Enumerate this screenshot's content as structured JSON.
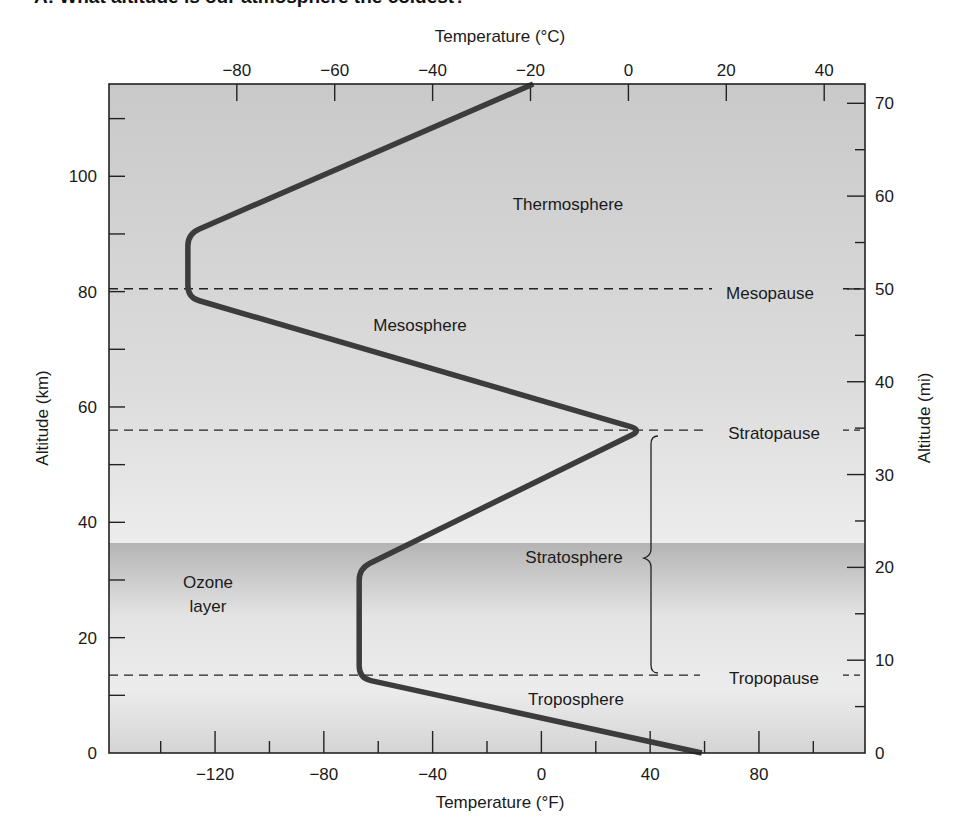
{
  "question": {
    "title": "A: What altitude is our atmosphere the coldest?"
  },
  "chart_data": {
    "type": "line",
    "title": "",
    "xlabel": "Temperature (°F)",
    "x2label": "Temperature (°C)",
    "ylabel": "Altitude (km)",
    "y2label": "Altitude (mi)",
    "xlim_F": [
      -159,
      119
    ],
    "ylim_km": [
      0,
      116
    ],
    "grid": false,
    "legend": null,
    "x_ticks_F": [
      -120,
      -80,
      -40,
      0,
      40,
      80
    ],
    "x_ticks_F_labels": [
      "−120",
      "−80",
      "−40",
      "0",
      "40",
      "80"
    ],
    "x_ticks_C": [
      -80,
      -60,
      -40,
      -20,
      0,
      20,
      40
    ],
    "x_ticks_C_labels": [
      "−80",
      "−60",
      "−40",
      "−20",
      "0",
      "20",
      "40"
    ],
    "y_ticks_km": [
      0,
      20,
      40,
      60,
      80,
      100
    ],
    "y_ticks_km_labels": [
      "0",
      "20",
      "40",
      "60",
      "80",
      "100"
    ],
    "y_ticks_mi": [
      0,
      10,
      20,
      30,
      40,
      50,
      60,
      70
    ],
    "y_ticks_mi_labels": [
      "0",
      "10",
      "20",
      "30",
      "40",
      "50",
      "60",
      "70"
    ],
    "series": [
      {
        "name": "Temperature profile",
        "x_F": [
          59,
          -67,
          -67,
          37,
          -130,
          -130,
          -3
        ],
        "y_km": [
          0,
          13,
          32,
          56,
          79,
          90,
          116
        ]
      }
    ],
    "boundaries": [
      {
        "label": "Tropopause",
        "altitude_km": 13.5
      },
      {
        "label": "Stratopause",
        "altitude_km": 56
      },
      {
        "label": "Mesopause",
        "altitude_km": 80.5
      }
    ],
    "regions": [
      {
        "label": "Troposphere"
      },
      {
        "label": "Stratosphere"
      },
      {
        "label": "Mesosphere"
      },
      {
        "label": "Thermosphere"
      },
      {
        "label": "Ozone layer",
        "line2": "layer",
        "line1": "Ozone",
        "range_km": [
          0,
          37
        ]
      }
    ]
  }
}
